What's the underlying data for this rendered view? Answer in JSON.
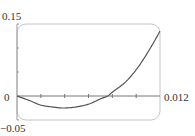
{
  "chart_data": {
    "type": "line",
    "title": "",
    "xlabel": "",
    "ylabel": "",
    "xlim": [
      0,
      0.012
    ],
    "ylim": [
      -0.05,
      0.15
    ],
    "grid": false,
    "legend": null,
    "x_tick_spacing": 0.002,
    "y_tick_spacing": 0.05,
    "tick_labels": {
      "y_max": "0.15",
      "y_min": "−0.05",
      "y_zero": "0",
      "x_max": "0.012"
    },
    "series": [
      {
        "name": "curve",
        "x": [
          0,
          0.0011,
          0.002,
          0.003,
          0.0039,
          0.0049,
          0.006,
          0.007,
          0.0076,
          0.008,
          0.0091,
          0.0101,
          0.0111,
          0.012
        ],
        "y": [
          0,
          -0.01,
          -0.019,
          -0.023,
          -0.025,
          -0.023,
          -0.017,
          -0.006,
          0,
          0.008,
          0.029,
          0.058,
          0.096,
          0.135
        ]
      }
    ]
  },
  "labels": {
    "y_top": "0.15",
    "y_zero": "0",
    "y_bottom": "−0.05",
    "x_right": "0.012"
  },
  "colors": {
    "frame": "#bdbdbd",
    "axis": "#777777",
    "curve": "#555555"
  }
}
